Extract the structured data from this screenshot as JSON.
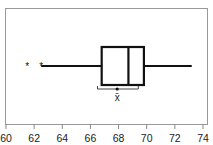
{
  "chart_data": {
    "type": "boxplot",
    "title": "",
    "xlabel": "",
    "ylabel": "",
    "orientation": "horizontal",
    "xlim": [
      60,
      74
    ],
    "xticks": [
      60,
      62,
      64,
      66,
      68,
      70,
      72,
      74
    ],
    "xtick_labels": [
      "60",
      "62",
      "64",
      "66",
      "68",
      "70",
      "72",
      "74"
    ],
    "grid": false,
    "box": {
      "whisker_low": 62.5,
      "q1": 66.8,
      "median": 68.7,
      "q3": 69.8,
      "whisker_high": 73.2,
      "outliers": [
        61.5,
        62.5
      ],
      "mean": 67.9,
      "mean_ci": [
        66.5,
        69.4
      ]
    },
    "annotations": [
      {
        "text": "x̄",
        "meaning": "mean with confidence interval"
      }
    ],
    "colors": {
      "line": "#111111",
      "frame": "#888888",
      "background": "#ffffff"
    }
  },
  "labels": {
    "mean_symbol": "x̄",
    "outlier_symbol": "*"
  }
}
